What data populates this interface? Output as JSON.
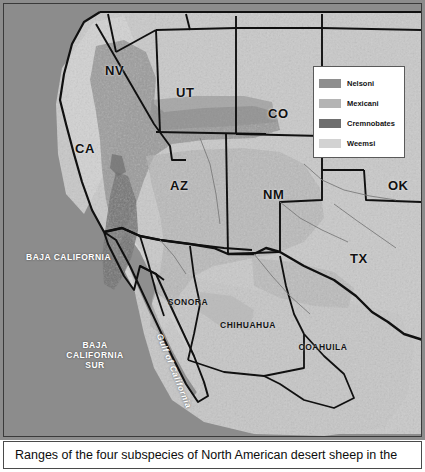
{
  "figure": {
    "caption": "Ranges of the four subspecies of North American desert sheep in the"
  },
  "legend": {
    "title": "",
    "items": [
      {
        "label": "Nelsoni",
        "color": "#8e8e8e",
        "icon": "color-swatch-icon"
      },
      {
        "label": "Mexicani",
        "color": "#b4b4b4",
        "icon": "color-swatch-icon"
      },
      {
        "label": "Cremnobates",
        "color": "#6e6e6e",
        "icon": "color-swatch-icon"
      },
      {
        "label": "Weemsi",
        "color": "#d2d2d2",
        "icon": "color-swatch-icon"
      }
    ]
  },
  "map": {
    "ocean_color": "#8c8c8c",
    "land_color": "#c9c9c9",
    "border_color": "#111111",
    "us_states": [
      {
        "code": "NV",
        "x": 101,
        "y": 66
      },
      {
        "code": "UT",
        "x": 175,
        "y": 88
      },
      {
        "code": "CO",
        "x": 267,
        "y": 109
      },
      {
        "code": "CA",
        "x": 74,
        "y": 144
      },
      {
        "code": "AZ",
        "x": 169,
        "y": 181
      },
      {
        "code": "NM",
        "x": 262,
        "y": 190
      },
      {
        "code": "OK",
        "x": 387,
        "y": 181
      },
      {
        "code": "TX",
        "x": 349,
        "y": 254
      }
    ],
    "mx_states": [
      {
        "name": "BAJA CALIFORNIA",
        "x": 28,
        "y": 252,
        "w": 72,
        "dark": false
      },
      {
        "name": "BAJA CALIFORNIA SUR",
        "x": 58,
        "y": 340,
        "w": 68,
        "dark": false
      },
      {
        "name": "SONORA",
        "x": 160,
        "y": 297,
        "w": 56,
        "dark": true
      },
      {
        "name": "CHIHUAHUA",
        "x": 215,
        "y": 320,
        "w": 64,
        "dark": true
      },
      {
        "name": "COAHUILA",
        "x": 294,
        "y": 342,
        "w": 56,
        "dark": true
      }
    ],
    "water_labels": [
      {
        "name": "Gulf of California",
        "x": 162,
        "y": 333
      }
    ]
  }
}
